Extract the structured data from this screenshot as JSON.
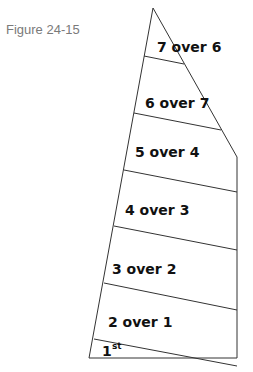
{
  "figure": {
    "caption": "Figure 24-15",
    "panels": [
      {
        "label": "7 over 6"
      },
      {
        "label": "6 over 7"
      },
      {
        "label": "5 over 4"
      },
      {
        "label": "4 over 3"
      },
      {
        "label": "3 over 2"
      },
      {
        "label": "2 over 1"
      },
      {
        "label": "1",
        "superscript": "st"
      }
    ]
  }
}
